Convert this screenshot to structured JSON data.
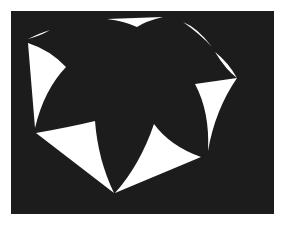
{
  "figure": {
    "width": 287,
    "height": 227,
    "background_color": "#ffffff",
    "panel": {
      "x": 11,
      "y": 11,
      "width": 263,
      "height": 203,
      "color": "#1c1c1c"
    },
    "wedge_color": "#ffffff",
    "shape_description": "Seven-lobed dark star inscribed in a heptagon; white curved wedges fill the gaps between lobes",
    "wedges": [
      {
        "name": "top",
        "d": "M107,19 L163,17 Q146,21 137,27 Q124,21 107,19 Z"
      },
      {
        "name": "top-left-sliver",
        "d": "M28,39 Q40,33 50,30 Q40,36 28,39 Z"
      },
      {
        "name": "left",
        "d": "M28,43 Q50,50 66,67 Q44,90 35,128 Z"
      },
      {
        "name": "bottom-left",
        "d": "M36,133 Q70,127 95,121 Q98,160 114,193 Z"
      },
      {
        "name": "bottom-right",
        "d": "M115,193 L201,157 Q170,146 154,124 Q140,165 115,193 Z"
      },
      {
        "name": "right",
        "d": "M195,84 L237,78 Q215,110 208,151 Q210,112 195,84 Z"
      },
      {
        "name": "upper-right-sliver-a",
        "d": "M183,22 Q198,28 212,47 Q200,34 183,22 Z"
      },
      {
        "name": "upper-right-sliver-b",
        "d": "M215,52 Q228,62 237,78 Q226,70 215,52 Z"
      }
    ]
  }
}
